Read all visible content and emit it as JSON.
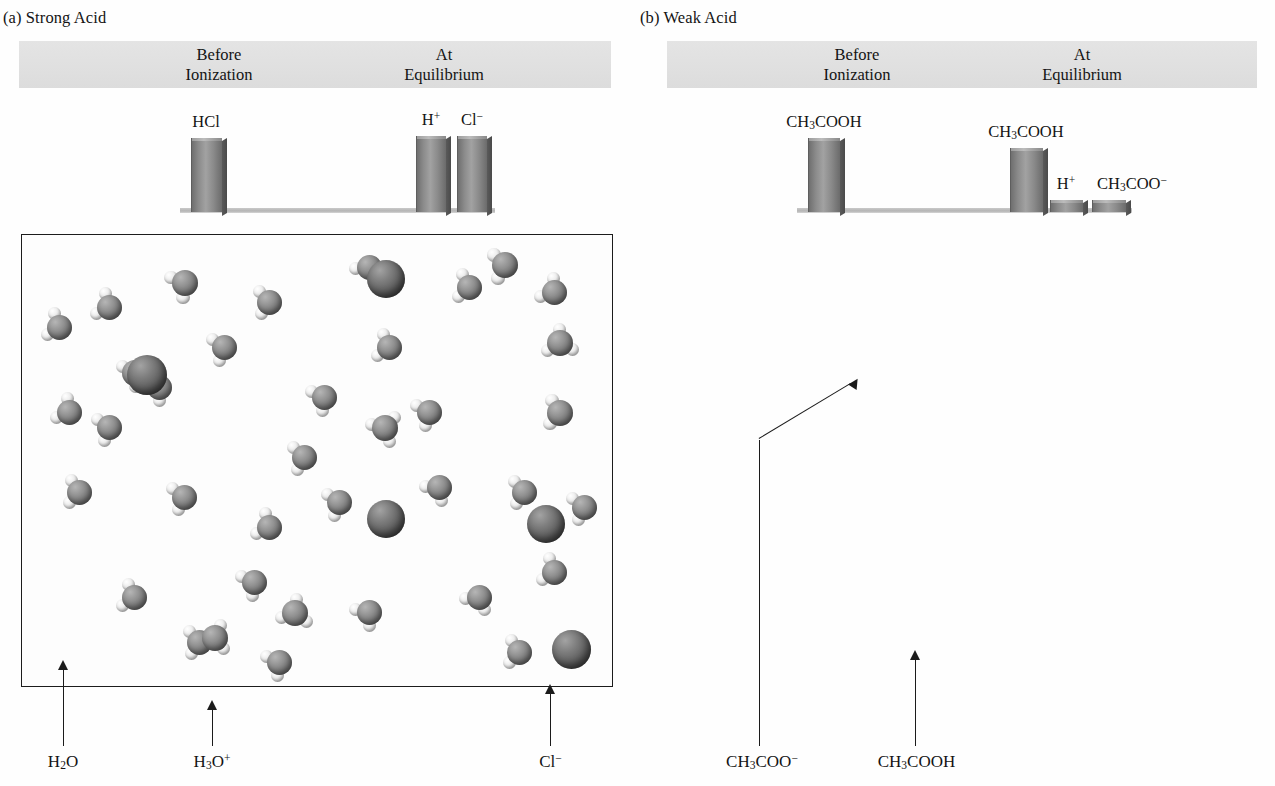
{
  "panel_a": {
    "title": "(a) Strong Acid",
    "band": {
      "before": {
        "line1": "Before",
        "line2": "Ionization"
      },
      "equilibrium": {
        "line1": "At",
        "line2": "Equilibrium"
      }
    },
    "bars": [
      {
        "label_html": "HCl",
        "label_plain": "HCl",
        "height_pct": 100,
        "group": "before"
      },
      {
        "label_html": "H<sup class=\"sup\">+</sup>",
        "label_plain": "H+",
        "height_pct": 100,
        "group": "equilibrium"
      },
      {
        "label_html": "Cl<sup class=\"sup\">−</sup>",
        "label_plain": "Cl-",
        "height_pct": 100,
        "group": "equilibrium"
      }
    ],
    "callouts": [
      {
        "label_html": "H<sub class=\"sub\">2</sub>O",
        "label_plain": "H2O"
      },
      {
        "label_html": "H<sub class=\"sub\">3</sub>O<sup class=\"sup\">+</sup>",
        "label_plain": "H3O+"
      },
      {
        "label_html": "Cl<sup class=\"sup\">−</sup>",
        "label_plain": "Cl-"
      }
    ]
  },
  "panel_b": {
    "title": "(b) Weak Acid",
    "band": {
      "before": {
        "line1": "Before",
        "line2": "Ionization"
      },
      "equilibrium": {
        "line1": "At",
        "line2": "Equilibrium"
      }
    },
    "bars": [
      {
        "label_html": "CH<sub class=\"sub\">3</sub>COOH",
        "label_plain": "CH3COOH",
        "height_pct": 100,
        "group": "before"
      },
      {
        "label_html": "CH<sub class=\"sub\">3</sub>COOH",
        "label_plain": "CH3COOH",
        "height_pct": 87,
        "group": "equilibrium"
      },
      {
        "label_html": "H<sup class=\"sup\">+</sup>",
        "label_plain": "H+",
        "height_pct": 16,
        "group": "equilibrium"
      },
      {
        "label_html": "CH<sub class=\"sub\">3</sub>COO<sup class=\"sup\">−</sup>",
        "label_plain": "CH3COO-",
        "height_pct": 16,
        "group": "equilibrium"
      }
    ],
    "callouts": [
      {
        "label_html": "CH<sub class=\"sub\">3</sub>COO<sup class=\"sup\">−</sup>",
        "label_plain": "CH3COO-"
      },
      {
        "label_html": "CH<sub class=\"sub\">3</sub>COOH",
        "label_plain": "CH3COOH"
      }
    ]
  },
  "chart_data": {
    "type": "bar",
    "charts": [
      {
        "panel": "(a) Strong Acid",
        "categories": [
          "HCl",
          "H+",
          "Cl-"
        ],
        "groups": [
          "Before Ionization",
          "At Equilibrium",
          "At Equilibrium"
        ],
        "values": [
          100,
          100,
          100
        ],
        "ylabel": "Relative concentration",
        "ylim": [
          0,
          100
        ],
        "grid": false,
        "legend": "none"
      },
      {
        "panel": "(b) Weak Acid",
        "categories": [
          "CH3COOH",
          "CH3COOH",
          "H+",
          "CH3COO-"
        ],
        "groups": [
          "Before Ionization",
          "At Equilibrium",
          "At Equilibrium",
          "At Equilibrium"
        ],
        "values": [
          100,
          87,
          16,
          16
        ],
        "ylabel": "Relative concentration",
        "ylim": [
          0,
          100
        ],
        "grid": false,
        "legend": "none"
      }
    ]
  },
  "colors": {
    "band": "#e1e1e1",
    "bar_face": "#8b8b8b",
    "box_border": "#1c1c1c",
    "water_sphere": "#8f8f8f",
    "chloride_sphere": "#575757",
    "carbon_sphere": "#121212",
    "hydrogen_sphere": "#ededed",
    "text": "#141414"
  }
}
